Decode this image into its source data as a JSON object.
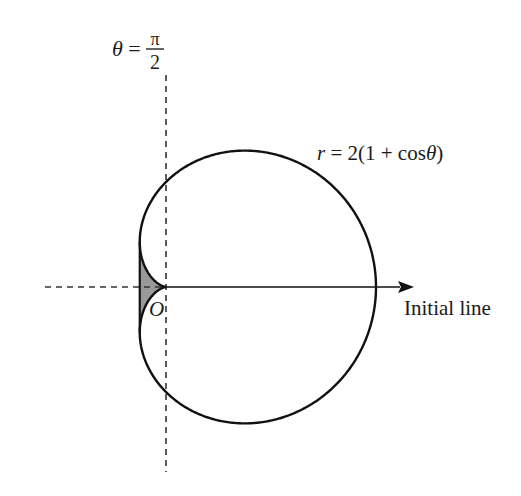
{
  "diagram": {
    "type": "polar-curve",
    "curve": {
      "label": "r = 2(1 + cosθ)",
      "label_parts": {
        "r": "r",
        "eq": " = 2(1 + cos",
        "theta": "θ",
        "close": ")"
      },
      "a": 2,
      "stroke": "#111111"
    },
    "half_line": {
      "label_theta": "θ",
      "label_eq": " = ",
      "numerator": "π",
      "denominator": "2"
    },
    "initial_line": {
      "label": "Initial line"
    },
    "pole": {
      "label": "O"
    },
    "shaded_region": {
      "description": "Region between the tangent line x = -1/2 and the cardioid near the cusp at O",
      "fill": "#999999"
    },
    "layout": {
      "pole_px": [
        166,
        287
      ],
      "unit_px": 52.5
    }
  }
}
